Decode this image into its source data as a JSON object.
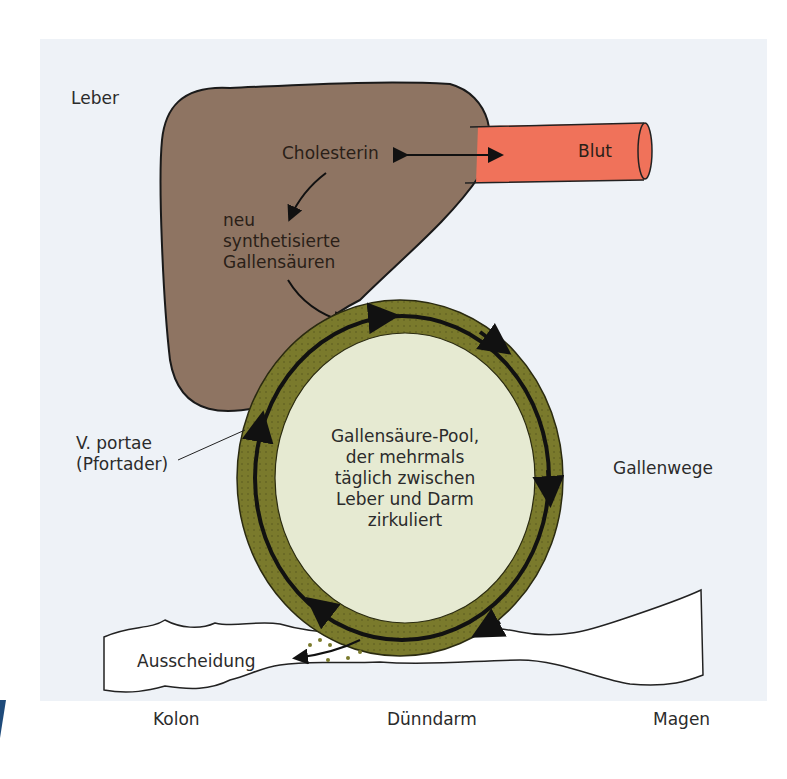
{
  "diagram": {
    "labels": {
      "liver": "Leber",
      "cholesterol": "Cholesterin",
      "blood": "Blut",
      "new_bile_acids": [
        "neu",
        "synthetisierte",
        "Gallensäuren"
      ],
      "portal_vein": [
        "V. portae",
        "(Pfortader)"
      ],
      "pool": [
        "Gallensäure-Pool,",
        "der mehrmals",
        "täglich zwischen",
        "Leber und Darm",
        "zirkuliert"
      ],
      "bile_ducts": "Gallenwege",
      "excretion": "Ausscheidung",
      "colon": "Kolon",
      "small_intestine": "Dünndarm",
      "stomach": "Magen"
    },
    "colors": {
      "background": "#eef2f7",
      "liver": "#8e7462",
      "blood_vessel": "#f0725a",
      "ring": "#7a7a2c",
      "pool_fill": "#e6ead2",
      "intestine": "#ffffff",
      "accent_mark": "#1e4a7a"
    }
  }
}
